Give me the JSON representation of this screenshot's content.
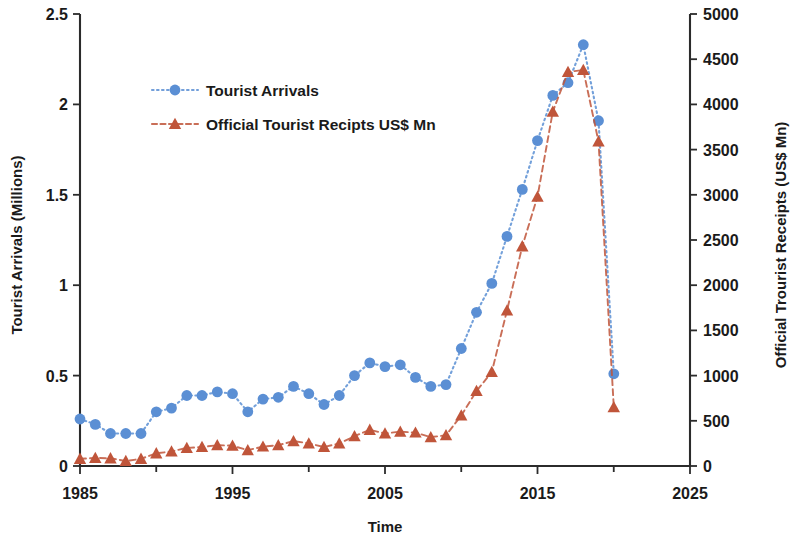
{
  "chart_data": {
    "type": "line",
    "title": "",
    "xlabel": "Time",
    "ylabel": "Tourist Arrivals (Millions)",
    "y2label": "Official Trourist Receipts (US$ Mn)",
    "xlim": [
      1985,
      2025
    ],
    "ylim": [
      0,
      2.5
    ],
    "y2lim": [
      0,
      5000
    ],
    "xticks": [
      "1985",
      "1995",
      "2005",
      "2015",
      "2025"
    ],
    "xtick_values": [
      1985,
      1995,
      2005,
      2015,
      2025
    ],
    "xtick_minor_values": [
      1990,
      2000,
      2010,
      2020
    ],
    "yticks": [
      "0",
      "0.5",
      "1",
      "1.5",
      "2",
      "2.5"
    ],
    "ytick_values": [
      0,
      0.5,
      1,
      1.5,
      2,
      2.5
    ],
    "y2ticks": [
      "0",
      "500",
      "1000",
      "1500",
      "2000",
      "2500",
      "3000",
      "3500",
      "4000",
      "4500",
      "5000"
    ],
    "y2tick_values": [
      0,
      500,
      1000,
      1500,
      2000,
      2500,
      3000,
      3500,
      4000,
      4500,
      5000
    ],
    "grid": false,
    "legend_position": "upper-left-inside",
    "x": [
      1985,
      1986,
      1987,
      1988,
      1989,
      1990,
      1991,
      1992,
      1993,
      1994,
      1995,
      1996,
      1997,
      1998,
      1999,
      2000,
      2001,
      2002,
      2003,
      2004,
      2005,
      2006,
      2007,
      2008,
      2009,
      2010,
      2011,
      2012,
      2013,
      2014,
      2015,
      2016,
      2017,
      2018,
      2019,
      2020
    ],
    "series": [
      {
        "name": "Tourist Arrivals",
        "axis": "left",
        "color": "#5B8FD4",
        "marker": "circle",
        "line_style": "dotted",
        "units": "Millions",
        "values": [
          0.26,
          0.23,
          0.18,
          0.18,
          0.18,
          0.3,
          0.32,
          0.39,
          0.39,
          0.41,
          0.4,
          0.3,
          0.37,
          0.38,
          0.44,
          0.4,
          0.34,
          0.39,
          0.5,
          0.57,
          0.55,
          0.56,
          0.49,
          0.44,
          0.45,
          0.65,
          0.85,
          1.01,
          1.27,
          1.53,
          1.8,
          2.05,
          2.12,
          2.33,
          1.91,
          0.51
        ]
      },
      {
        "name": "Official Tourist Recipts US$ Mn",
        "axis": "right",
        "color": "#C0553A",
        "marker": "triangle",
        "line_style": "dashed",
        "units": "US$ Mn",
        "values": [
          80,
          90,
          85,
          55,
          80,
          140,
          160,
          200,
          210,
          230,
          225,
          175,
          215,
          230,
          275,
          250,
          210,
          250,
          330,
          400,
          360,
          380,
          370,
          320,
          340,
          560,
          830,
          1040,
          1720,
          2430,
          2980,
          3920,
          4360,
          4380,
          3590,
          650
        ]
      }
    ]
  },
  "legend": {
    "items": [
      {
        "label": "Tourist Arrivals",
        "color": "#5B8FD4",
        "marker": "circle"
      },
      {
        "label": "Official Tourist Recipts US$ Mn",
        "color": "#C0553A",
        "marker": "triangle"
      }
    ]
  },
  "axes": {
    "left_title": "Tourist Arrivals (Millions)",
    "right_title": "Official Trourist Receipts (US$ Mn)",
    "bottom_title": "Time"
  },
  "colors": {
    "series_blue": "#5B8FD4",
    "series_red": "#C0553A",
    "axis": "#2b2b2b",
    "text": "#1a1a1a",
    "background": "#ffffff"
  }
}
